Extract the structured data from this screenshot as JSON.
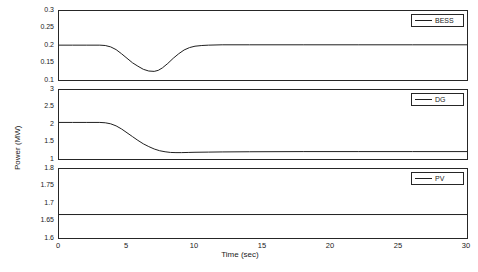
{
  "chart_data": {
    "type": "line",
    "title": "",
    "xlabel": "Time (sec)",
    "ylabel": "Power (MW)",
    "xlim": [
      0,
      30
    ],
    "xticks": [
      0,
      5,
      10,
      15,
      20,
      25,
      30
    ],
    "grid": false,
    "panels": [
      {
        "name": "BESS",
        "legend": "BESS",
        "ylim": [
          0.1,
          0.3
        ],
        "yticks": [
          0.1,
          0.15,
          0.2,
          0.25,
          0.3
        ],
        "ytick_labels": [
          "0.1",
          "0.15",
          "0.2",
          "0.25",
          "0.3"
        ],
        "series": [
          {
            "name": "BESS",
            "color": "#1f1f1f",
            "x": [
              0,
              1,
              2,
              3,
              3.4,
              3.8,
              4.2,
              4.6,
              5.0,
              5.4,
              5.8,
              6.2,
              6.6,
              7.0,
              7.3,
              7.6,
              8.0,
              8.4,
              8.8,
              9.2,
              9.6,
              10.0,
              10.5,
              11.0,
              12.0,
              14.0,
              18.0,
              22.0,
              26.0,
              30.0
            ],
            "y": [
              0.201,
              0.201,
              0.201,
              0.201,
              0.2,
              0.196,
              0.188,
              0.176,
              0.163,
              0.15,
              0.14,
              0.131,
              0.126,
              0.125,
              0.128,
              0.135,
              0.148,
              0.163,
              0.176,
              0.187,
              0.194,
              0.198,
              0.2,
              0.201,
              0.202,
              0.202,
              0.202,
              0.202,
              0.202,
              0.202
            ]
          }
        ]
      },
      {
        "name": "DG",
        "legend": "DG",
        "ylim": [
          1,
          3
        ],
        "yticks": [
          1,
          1.5,
          2,
          2.5,
          3
        ],
        "ytick_labels": [
          "1",
          "1.5",
          "2",
          "2.5",
          "3"
        ],
        "series": [
          {
            "name": "DG",
            "color": "#1f1f1f",
            "x": [
              0,
              1,
              2,
              3,
              3.4,
              3.8,
              4.2,
              4.6,
              5.0,
              5.4,
              5.8,
              6.2,
              6.6,
              7.0,
              7.4,
              7.8,
              8.2,
              8.6,
              9.0,
              9.5,
              10.0,
              11.0,
              12.0,
              14.0,
              18.0,
              22.0,
              26.0,
              30.0
            ],
            "y": [
              2.06,
              2.06,
              2.06,
              2.06,
              2.05,
              2.02,
              1.96,
              1.87,
              1.76,
              1.65,
              1.54,
              1.44,
              1.36,
              1.29,
              1.24,
              1.21,
              1.19,
              1.185,
              1.185,
              1.19,
              1.195,
              1.2,
              1.205,
              1.21,
              1.215,
              1.215,
              1.215,
              1.215
            ]
          }
        ]
      },
      {
        "name": "PV",
        "legend": "PV",
        "ylim": [
          1.6,
          1.8
        ],
        "yticks": [
          1.6,
          1.65,
          1.7,
          1.75,
          1.8
        ],
        "ytick_labels": [
          "1.6",
          "1.65",
          "1.7",
          "1.75",
          "1.8"
        ],
        "series": [
          {
            "name": "PV",
            "color": "#1f1f1f",
            "x": [
              0,
              5,
              10,
              15,
              20,
              25,
              30
            ],
            "y": [
              1.668,
              1.668,
              1.668,
              1.668,
              1.668,
              1.668,
              1.668
            ]
          }
        ]
      }
    ]
  }
}
